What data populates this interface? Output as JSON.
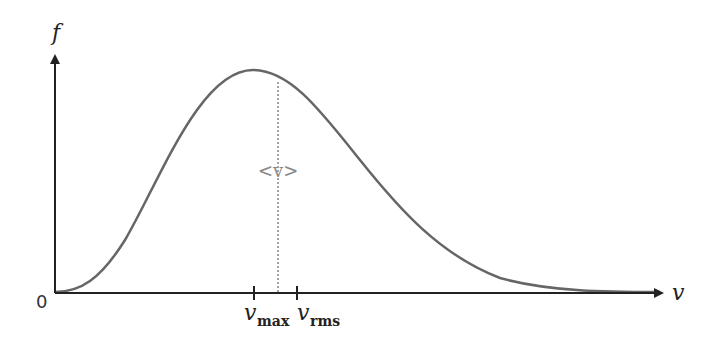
{
  "diagram": {
    "y_axis_label": "f",
    "x_axis_label": "v",
    "origin_label": "0",
    "mean_label": "<v>",
    "ticks": [
      {
        "main": "v",
        "sub": "max"
      },
      {
        "main": "v",
        "sub": "rms"
      }
    ],
    "colors": {
      "curve": "#666666",
      "axes": "#222222",
      "mean_line": "#888888",
      "mean_label": "#888888"
    }
  }
}
